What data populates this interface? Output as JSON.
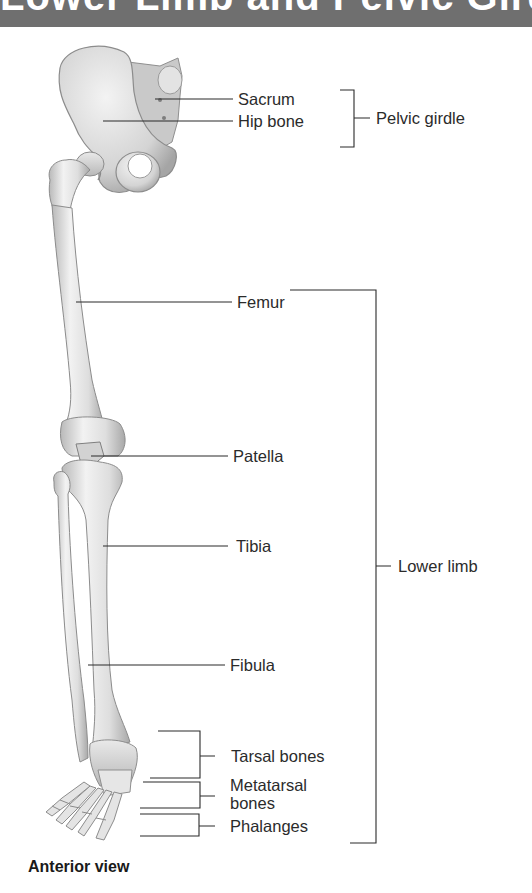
{
  "header": {
    "title_fragment": "Lower Limb and Pelvic Girdle",
    "color": "#6f6f6f"
  },
  "figure": {
    "caption": "Anterior view",
    "line_color": "#2b2b2b",
    "bone_colors": {
      "light": "#efefef",
      "mid": "#d6d6d6",
      "dark": "#9c9c9c"
    }
  },
  "labels": {
    "sacrum": "Sacrum",
    "hip_bone": "Hip bone",
    "pelvic_girdle": "Pelvic girdle",
    "femur": "Femur",
    "patella": "Patella",
    "tibia": "Tibia",
    "fibula": "Fibula",
    "lower_limb": "Lower limb",
    "tarsal_bones": "Tarsal bones",
    "metatarsal_bones_line1": "Metatarsal",
    "metatarsal_bones_line2": "bones",
    "phalanges": "Phalanges"
  }
}
